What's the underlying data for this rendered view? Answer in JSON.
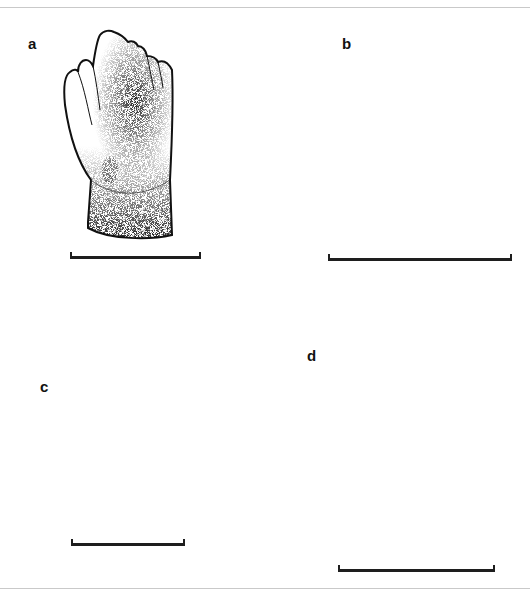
{
  "figure": {
    "panels": [
      {
        "id": "a",
        "label": "a",
        "subject": "tooth-crown-multicusped-lateral-view",
        "has_scale_bar": true
      },
      {
        "id": "b",
        "label": "b",
        "subject": "tooth-crown-multicusped-lingual-view",
        "has_scale_bar": true
      },
      {
        "id": "c",
        "label": "c",
        "subject": "tooth-root-column-view",
        "has_scale_bar": true
      },
      {
        "id": "d",
        "label": "d",
        "subject": "tooth-bilobed-crown-view",
        "has_scale_bar": true
      }
    ],
    "colors": {
      "ink": "#111111",
      "frame": "#c9c9c9",
      "background": "#ffffff"
    }
  }
}
